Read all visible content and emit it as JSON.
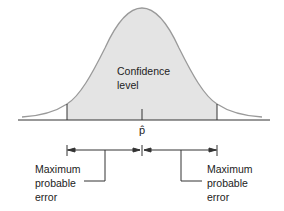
{
  "diagram": {
    "type": "normal-distribution-confidence-interval",
    "center_label": "p̂",
    "region_label": {
      "line1": "Confidence",
      "line2": "level"
    },
    "left_annotation": {
      "line1": "Maximum",
      "line2": "probable",
      "line3": "error"
    },
    "right_annotation": {
      "line1": "Maximum",
      "line2": "probable",
      "line3": "error"
    },
    "colors": {
      "fill": "#e4e4e4",
      "curve": "#9a9a9a",
      "lines": "#333333"
    }
  }
}
